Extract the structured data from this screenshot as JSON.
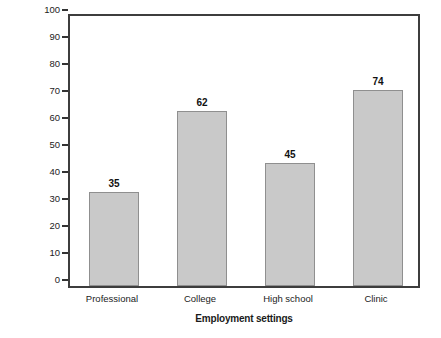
{
  "chart_data": {
    "type": "bar",
    "title": "",
    "categories": [
      "Professional",
      "College",
      "High school",
      "Clinic"
    ],
    "values": [
      35,
      62,
      45,
      74
    ],
    "bar_heights_percent": [
      35,
      65,
      45.5,
      72.5
    ],
    "data_labels": [
      "35",
      "62",
      "45",
      "74"
    ],
    "xlabel": "Employment settings",
    "ylabel": "Percent of athletic trainers",
    "ylim": [
      0,
      100
    ],
    "ytick_values": [
      0,
      10,
      20,
      30,
      40,
      50,
      60,
      70,
      80,
      90,
      100
    ],
    "ytick_labels": [
      "0",
      "10",
      "20",
      "30",
      "40",
      "50",
      "60",
      "70",
      "80",
      "90",
      "100"
    ],
    "grid": false,
    "legend": null,
    "colors": {
      "bar_fill": "#c9c9c9",
      "bar_edge": "#8f8f8f",
      "frame": "#3d3d3d",
      "text": "#1a1a1a",
      "background": "#ffffff"
    }
  }
}
